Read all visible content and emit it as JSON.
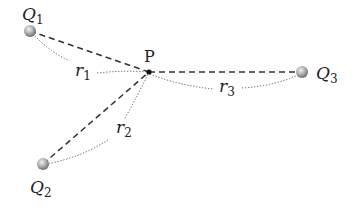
{
  "diagram": {
    "title": "",
    "point": {
      "label": "P",
      "x": 149,
      "y": 72
    },
    "charges": [
      {
        "id": "Q1",
        "label": "Q",
        "subscript": "1",
        "x": 30,
        "y": 31,
        "label_x": 22,
        "label_y": 20
      },
      {
        "id": "Q2",
        "label": "Q",
        "subscript": "2",
        "x": 43,
        "y": 164,
        "label_x": 30,
        "label_y": 194
      },
      {
        "id": "Q3",
        "label": "Q",
        "subscript": "3",
        "x": 302,
        "y": 72,
        "label_x": 317,
        "label_y": 79
      }
    ],
    "distances": [
      {
        "id": "r1",
        "label": "r",
        "subscript": "1",
        "x": 75,
        "y": 77
      },
      {
        "id": "r2",
        "label": "r",
        "subscript": "2",
        "x": 116,
        "y": 135
      },
      {
        "id": "r3",
        "label": "r",
        "subscript": "3",
        "x": 218,
        "y": 93
      }
    ],
    "colors": {
      "dashed_line": "#333333",
      "dotted_arc": "#555555",
      "charge_light": "#e6e6e6",
      "charge_dark": "#7a7a7a",
      "point": "#111111"
    }
  }
}
